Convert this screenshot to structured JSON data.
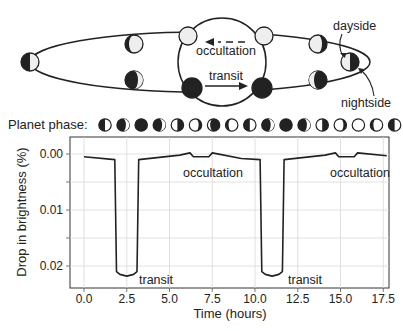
{
  "diagram": {
    "labels": {
      "occultation": "occultation",
      "transit": "transit",
      "dayside": "dayside",
      "nightside": "nightside"
    }
  },
  "phase_row": {
    "label": "Planet phase:",
    "phases": [
      "first-quarter",
      "crescent-dark",
      "new",
      "crescent-dark",
      "third-quarter",
      "gibbous",
      "gibbous-light",
      "crescent-light",
      "first-quarter",
      "crescent-dark",
      "new",
      "crescent-dark",
      "third-quarter",
      "gibbous",
      "full",
      "crescent-light",
      "first-quarter"
    ]
  },
  "chart_data": {
    "type": "line",
    "title": "",
    "xlabel": "Time (hours)",
    "ylabel": "Drop in brightness (%)",
    "xlim": [
      -0.8,
      18.0
    ],
    "ylim": [
      -0.003,
      0.0245
    ],
    "y_inverted": true,
    "grid": true,
    "x_ticks": [
      "0.0",
      "2.5",
      "5.0",
      "7.5",
      "10.0",
      "12.5",
      "15.0",
      "17.5"
    ],
    "y_ticks": [
      "0.00",
      "0.01",
      "0.02"
    ],
    "series": [
      {
        "name": "light curve",
        "x": [
          0.0,
          1.8,
          1.9,
          2.1,
          2.5,
          2.9,
          3.1,
          3.2,
          5.6,
          6.2,
          6.4,
          7.3,
          7.5,
          9.2,
          10.3,
          10.4,
          10.6,
          11.0,
          11.4,
          11.6,
          11.7,
          14.1,
          14.7,
          14.9,
          15.8,
          16.0,
          17.7
        ],
        "y": [
          0.0005,
          0.001,
          0.021,
          0.0215,
          0.0218,
          0.0215,
          0.021,
          0.001,
          0.0002,
          -0.0002,
          0.0005,
          0.0005,
          -0.0002,
          0.0008,
          0.001,
          0.021,
          0.0215,
          0.0218,
          0.0215,
          0.021,
          0.001,
          0.0002,
          -0.0002,
          0.0005,
          0.0005,
          -0.0002,
          0.0003
        ]
      }
    ],
    "annotations": [
      {
        "text": "occultation",
        "x": 7.0,
        "y": 0.0025
      },
      {
        "text": "transit",
        "x": 3.4,
        "y": 0.0215
      },
      {
        "text": "occultation",
        "x": 15.6,
        "y": 0.0025
      },
      {
        "text": "transit",
        "x": 12.0,
        "y": 0.0215
      }
    ]
  },
  "axis": {
    "x_ticks": [
      "0.0",
      "2.5",
      "5.0",
      "7.5",
      "10.0",
      "12.5",
      "15.0",
      "17.5"
    ],
    "y_ticks": [
      "0.00",
      "0.01",
      "0.02"
    ],
    "xlabel": "Time (hours)",
    "ylabel": "Drop in brightness (%)"
  },
  "plot_labels": {
    "occultation_1": "occultation",
    "occultation_2": "occultation",
    "transit_1": "transit",
    "transit_2": "transit"
  }
}
